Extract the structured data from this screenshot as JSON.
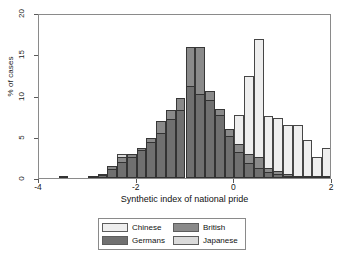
{
  "chart_data": {
    "type": "bar",
    "subtype": "overlaid-histogram",
    "title": "",
    "xlabel": "Synthetic index of national pride",
    "ylabel": "% of cases",
    "xlim": [
      -4,
      2
    ],
    "ylim": [
      0,
      20
    ],
    "xticks": [
      -4,
      -2,
      0,
      2
    ],
    "xtick_labels": [
      "-4",
      "-2",
      "0",
      "2"
    ],
    "yticks": [
      0,
      5,
      10,
      15,
      20
    ],
    "ytick_labels": [
      "0",
      "5",
      "10",
      "15",
      "20"
    ],
    "grid": false,
    "legend_position": "bottom-center",
    "bin_width": 0.2,
    "colors": {
      "Chinese": "#eeeeee",
      "British": "#8a8a8a",
      "Germans": "#707070",
      "Japanese": "#dadada",
      "frame": "#8a8a8a",
      "bar_edge": "#282828",
      "background": "#ffffff",
      "text": "#111111"
    },
    "series": [
      {
        "name": "Germans",
        "color": "#707070",
        "x": [
          -3.6,
          -3.0,
          -2.8,
          -2.6,
          -2.4,
          -2.2,
          -2.0,
          -1.8,
          -1.6,
          -1.4,
          -1.2,
          -1.0,
          -0.8,
          -0.6,
          -0.4,
          -0.2,
          0.0,
          0.2,
          0.4,
          0.6,
          0.8,
          1.0,
          1.2,
          1.4,
          1.6,
          1.8
        ],
        "values": [
          0.3,
          0.2,
          0.4,
          1.1,
          1.9,
          2.6,
          3.4,
          4.4,
          5.5,
          7.1,
          8.3,
          11.1,
          10.2,
          9.5,
          7.6,
          5.1,
          3.2,
          1.8,
          1.2,
          0.7,
          0.5,
          0.3,
          0.2,
          0.2,
          0.2,
          0.3
        ]
      },
      {
        "name": "British",
        "color": "#8a8a8a",
        "x": [
          -3.0,
          -2.8,
          -2.6,
          -2.4,
          -2.2,
          -2.0,
          -1.8,
          -1.6,
          -1.4,
          -1.2,
          -1.0,
          -0.8,
          -0.6,
          -0.4,
          -0.2,
          0.0,
          0.2,
          0.4,
          0.6,
          0.8,
          1.0,
          1.2,
          1.4,
          1.6,
          1.8
        ],
        "values": [
          0.2,
          0.5,
          1.4,
          2.6,
          2.9,
          3.6,
          4.8,
          6.9,
          8.2,
          9.7,
          15.9,
          15.9,
          10.6,
          8.4,
          5.9,
          4.1,
          2.9,
          2.6,
          1.2,
          0.8,
          0.5,
          0.3,
          0.2,
          0.2,
          0.2
        ]
      },
      {
        "name": "Japanese",
        "color": "#dadada",
        "x": [
          -2.4,
          -2.2,
          -2.0,
          -1.8,
          -1.6,
          -1.4,
          -1.2,
          -1.0,
          -0.8,
          -0.6,
          -0.4,
          -0.2,
          0.0,
          0.2
        ],
        "values": [
          2.9,
          2.6,
          3.6,
          4.8,
          6.9,
          5.6,
          8.2,
          15.9,
          15.9,
          10.6,
          8.4,
          5.9,
          4.1,
          2.9
        ]
      },
      {
        "name": "Chinese",
        "color": "#eeeeee",
        "x": [
          -0.4,
          -0.2,
          0.0,
          0.2,
          0.4,
          0.6,
          0.8,
          1.0,
          1.2,
          1.4,
          1.6,
          1.8
        ],
        "values": [
          2.6,
          3.4,
          7.6,
          12.4,
          16.8,
          7.5,
          7.3,
          6.4,
          6.4,
          4.6,
          2.6,
          3.6
        ]
      }
    ],
    "legend_entries": [
      {
        "label": "Chinese",
        "color": "#eeeeee"
      },
      {
        "label": "British",
        "color": "#8a8a8a"
      },
      {
        "label": "Germans",
        "color": "#707070"
      },
      {
        "label": "Japanese",
        "color": "#dadada"
      }
    ]
  }
}
